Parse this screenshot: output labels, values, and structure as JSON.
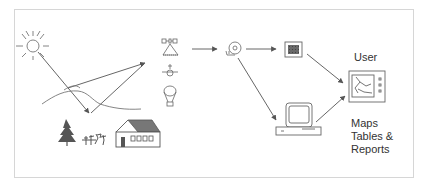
{
  "diagram": {
    "type": "remote-sensing-workflow",
    "colors": {
      "line": "#555555",
      "frame": "#d6d6d6",
      "fill_dark": "#555555",
      "fill_roof": "#777777",
      "text": "#333333"
    },
    "nodes": [
      {
        "id": "sun",
        "icon": "sun-icon"
      },
      {
        "id": "terrain",
        "icon": "terrain-lines"
      },
      {
        "id": "ground-objects",
        "icons": [
          "tree-icon",
          "plants-icon",
          "house-icon"
        ]
      },
      {
        "id": "platforms",
        "icons": [
          "satellite-icon",
          "aircraft-icon",
          "balloon-icon"
        ]
      },
      {
        "id": "storage",
        "icon": "tape-disk-icon"
      },
      {
        "id": "image",
        "icon": "image-raster-icon"
      },
      {
        "id": "computer",
        "icon": "computer-icon"
      },
      {
        "id": "user-display",
        "icon": "map-display-icon"
      }
    ],
    "edges": [
      [
        "sun",
        "terrain"
      ],
      [
        "terrain",
        "platforms"
      ],
      [
        "platforms",
        "storage"
      ],
      [
        "storage",
        "image"
      ],
      [
        "storage",
        "computer"
      ],
      [
        "image",
        "user-display"
      ],
      [
        "computer",
        "user-display"
      ]
    ],
    "labels": {
      "user": "User",
      "output_line1": "Maps",
      "output_line2": "Tables &",
      "output_line3": "Reports"
    }
  }
}
